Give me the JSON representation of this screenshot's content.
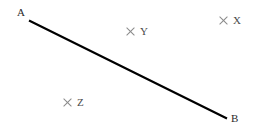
{
  "diagram": {
    "background_color": "#ffffff",
    "segment": {
      "name": "segment-AB",
      "color": "#000000",
      "stroke_width": 2.2,
      "x1": 30,
      "y1": 21,
      "x2": 226,
      "y2": 118
    },
    "endpoints": [
      {
        "id": "A",
        "label": "A",
        "x": 30,
        "y": 21,
        "label_x": 17,
        "label_y": 7
      },
      {
        "id": "B",
        "label": "B",
        "x": 226,
        "y": 118,
        "label_x": 231,
        "label_y": 113
      }
    ],
    "markers": [
      {
        "id": "X",
        "label": "X",
        "glyph": "cross-marker-icon",
        "color": "#8a8a8a",
        "x": 223,
        "y": 21
      },
      {
        "id": "Y",
        "label": "Y",
        "glyph": "cross-marker-icon",
        "color": "#8a8a8a",
        "x": 130,
        "y": 32
      },
      {
        "id": "Z",
        "label": "Z",
        "glyph": "cross-marker-icon",
        "color": "#8a8a8a",
        "x": 67,
        "y": 103
      }
    ]
  }
}
